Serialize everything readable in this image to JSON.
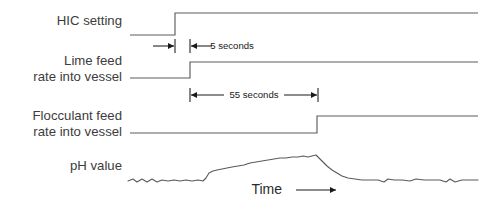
{
  "figure": {
    "type": "timing-diagram",
    "background_color": "#ffffff",
    "trace_color": "#5d5d5d",
    "annotation_color": "#1a1a1a",
    "label_color": "#3c3c3c",
    "width": 498,
    "height": 207
  },
  "signals": [
    {
      "id": "hic-setting",
      "label": "HIC setting",
      "label_lines": [
        "HIC setting"
      ],
      "type": "step",
      "baseline_y": 35,
      "high_y": 13,
      "start_x": 130,
      "step_x": 175,
      "end_x": 478
    },
    {
      "id": "lime-feed",
      "label": "Lime feed rate into vessel",
      "label_lines": [
        "Lime feed",
        "rate into vessel"
      ],
      "type": "step",
      "baseline_y": 78,
      "high_y": 62,
      "start_x": 130,
      "step_x": 190,
      "end_x": 478
    },
    {
      "id": "flocculant-feed",
      "label": "Flocculant feed rate into vessel",
      "label_lines": [
        "Flocculant feed",
        "rate into vessel"
      ],
      "type": "step",
      "baseline_y": 133,
      "high_y": 116,
      "start_x": 130,
      "step_x": 317,
      "end_x": 478
    },
    {
      "id": "ph-value",
      "label": "pH value",
      "label_lines": [
        "pH value"
      ],
      "type": "analog-curve",
      "baseline_y": 181,
      "peak_y": 156,
      "start_x": 128,
      "end_x": 478
    }
  ],
  "dimensions": [
    {
      "id": "five-seconds",
      "text": "5 seconds",
      "value": 5,
      "unit": "seconds",
      "y": 46,
      "from_x": 175,
      "to_x": 190,
      "style": "outward-arrows",
      "label_x": 232
    },
    {
      "id": "fifty-five-seconds",
      "text": "55 seconds",
      "value": 55,
      "unit": "seconds",
      "y": 95,
      "from_x": 190,
      "to_x": 318,
      "style": "inward-arrows",
      "label_x": 254
    }
  ],
  "axis": {
    "time_label": "Time",
    "time_arrow": "→",
    "label_x": 282,
    "label_y": 190,
    "arrow_from_x": 296,
    "arrow_to_x": 336
  },
  "chart_data": {
    "type": "line",
    "title": "",
    "xlabel": "Time",
    "ylabel": "",
    "grid": false,
    "legend": "none",
    "series": [
      {
        "name": "HIC setting",
        "kind": "step",
        "points": [
          [
            130,
            0
          ],
          [
            175,
            0
          ],
          [
            175,
            1
          ],
          [
            478,
            1
          ]
        ]
      },
      {
        "name": "Lime feed rate into vessel",
        "kind": "step",
        "points": [
          [
            130,
            0
          ],
          [
            190,
            0
          ],
          [
            190,
            1
          ],
          [
            478,
            1
          ]
        ]
      },
      {
        "name": "Flocculant feed rate into vessel",
        "kind": "step",
        "points": [
          [
            130,
            0
          ],
          [
            317,
            0
          ],
          [
            317,
            1
          ],
          [
            478,
            1
          ]
        ]
      },
      {
        "name": "pH value",
        "kind": "analog",
        "points": [
          [
            128,
            181
          ],
          [
            133,
            179
          ],
          [
            137,
            182
          ],
          [
            142,
            179
          ],
          [
            147,
            182
          ],
          [
            152,
            179
          ],
          [
            157,
            182
          ],
          [
            162,
            180
          ],
          [
            168,
            181
          ],
          [
            174,
            180
          ],
          [
            180,
            181
          ],
          [
            186,
            180
          ],
          [
            192,
            181
          ],
          [
            198,
            180
          ],
          [
            203,
            181
          ],
          [
            206,
            178
          ],
          [
            209,
            173
          ],
          [
            213,
            171
          ],
          [
            217,
            170
          ],
          [
            222,
            169
          ],
          [
            227,
            168
          ],
          [
            232,
            167
          ],
          [
            238,
            166
          ],
          [
            244,
            165
          ],
          [
            250,
            163
          ],
          [
            256,
            162
          ],
          [
            262,
            161
          ],
          [
            268,
            160
          ],
          [
            274,
            159
          ],
          [
            280,
            158
          ],
          [
            286,
            158
          ],
          [
            292,
            157
          ],
          [
            298,
            157
          ],
          [
            303,
            156
          ],
          [
            308,
            157
          ],
          [
            312,
            156
          ],
          [
            316,
            155
          ],
          [
            318,
            157
          ],
          [
            322,
            161
          ],
          [
            327,
            166
          ],
          [
            332,
            170
          ],
          [
            337,
            173
          ],
          [
            342,
            176
          ],
          [
            348,
            178
          ],
          [
            355,
            179
          ],
          [
            362,
            180
          ],
          [
            370,
            180
          ],
          [
            378,
            180
          ],
          [
            384,
            182
          ],
          [
            388,
            179
          ],
          [
            394,
            180
          ],
          [
            402,
            180
          ],
          [
            410,
            181
          ],
          [
            416,
            179
          ],
          [
            424,
            180
          ],
          [
            432,
            180
          ],
          [
            440,
            180
          ],
          [
            446,
            182
          ],
          [
            450,
            179
          ],
          [
            455,
            182
          ],
          [
            462,
            180
          ],
          [
            470,
            180
          ],
          [
            478,
            180
          ]
        ]
      }
    ],
    "annotations": [
      {
        "text": "5 seconds",
        "from_x": 175,
        "to_x": 190
      },
      {
        "text": "55 seconds",
        "from_x": 190,
        "to_x": 318
      }
    ]
  }
}
